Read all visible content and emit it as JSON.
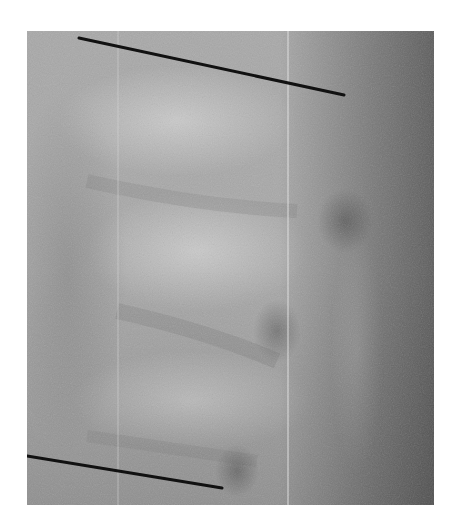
{
  "figure": {
    "kind": "lateral spine radiograph",
    "colormap": "grayscale",
    "frame": {
      "x": 27,
      "y": 31,
      "width": 407,
      "height": 474
    },
    "colors": {
      "background": "#ffffff",
      "base_gray": "#a9a9a9",
      "light_gray": "#c2c2c2",
      "dark_gray": "#5e5e5e",
      "measurement_line": "#111111"
    },
    "measurement_lines": [
      {
        "name": "upper-endplate-line",
        "x1": 52,
        "y1": 7,
        "x2": 317,
        "y2": 64
      },
      {
        "name": "lower-endplate-line",
        "x1": 0,
        "y1": 425,
        "x2": 195,
        "y2": 457
      }
    ],
    "artifacts": [
      {
        "name": "vertical-streak",
        "x": 91
      },
      {
        "name": "vertical-streak",
        "x": 261
      }
    ]
  }
}
